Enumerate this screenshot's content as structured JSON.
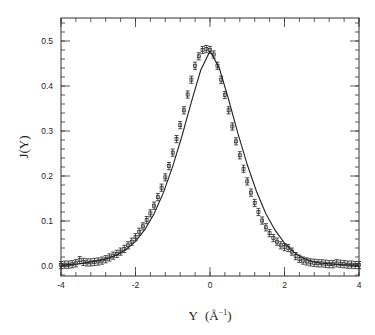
{
  "chart_data": {
    "type": "scatter",
    "title": "",
    "xlabel": "Y (Å⁻¹)",
    "xlabel_main": "Y",
    "xlabel_unit": "(Å",
    "xlabel_sup": "−1",
    "xlabel_close": ")",
    "ylabel": "J(Y)",
    "xlim": [
      -4,
      4
    ],
    "ylim": [
      -0.02,
      0.55
    ],
    "x_ticks": [
      -4,
      -2,
      0,
      2,
      4
    ],
    "x_tick_labels": [
      "-4",
      "-2",
      "0",
      "2",
      "4"
    ],
    "y_ticks": [
      0.0,
      0.1,
      0.2,
      0.3,
      0.4,
      0.5
    ],
    "y_tick_labels": [
      "0.0",
      "0.1",
      "0.2",
      "0.3",
      "0.4",
      "0.5"
    ],
    "x_minor_step": 0.4,
    "y_minor_step": 0.02,
    "grid": false,
    "legend": "none",
    "series": [
      {
        "name": "experimental data",
        "style": "points-with-errorbars",
        "x": [
          -4.0,
          -3.9,
          -3.8,
          -3.7,
          -3.6,
          -3.5,
          -3.4,
          -3.3,
          -3.2,
          -3.1,
          -3.0,
          -2.9,
          -2.8,
          -2.7,
          -2.6,
          -2.5,
          -2.4,
          -2.3,
          -2.2,
          -2.1,
          -2.0,
          -1.9,
          -1.8,
          -1.7,
          -1.6,
          -1.5,
          -1.4,
          -1.3,
          -1.2,
          -1.1,
          -1.0,
          -0.9,
          -0.8,
          -0.7,
          -0.6,
          -0.5,
          -0.4,
          -0.3,
          -0.2,
          -0.1,
          0.0,
          0.1,
          0.2,
          0.3,
          0.4,
          0.5,
          0.6,
          0.7,
          0.8,
          0.9,
          1.0,
          1.1,
          1.2,
          1.3,
          1.4,
          1.5,
          1.6,
          1.7,
          1.8,
          1.9,
          2.0,
          2.1,
          2.2,
          2.3,
          2.4,
          2.5,
          2.6,
          2.7,
          2.8,
          2.9,
          3.0,
          3.1,
          3.2,
          3.3,
          3.4,
          3.5,
          3.6,
          3.7,
          3.8,
          3.9,
          4.0
        ],
        "y": [
          0.002,
          0.003,
          0.003,
          0.004,
          0.006,
          0.013,
          0.009,
          0.008,
          0.008,
          0.009,
          0.01,
          0.012,
          0.015,
          0.019,
          0.023,
          0.027,
          0.032,
          0.038,
          0.046,
          0.054,
          0.064,
          0.076,
          0.088,
          0.102,
          0.117,
          0.134,
          0.153,
          0.174,
          0.197,
          0.222,
          0.252,
          0.282,
          0.313,
          0.346,
          0.381,
          0.414,
          0.445,
          0.466,
          0.48,
          0.482,
          0.48,
          0.47,
          0.445,
          0.414,
          0.38,
          0.346,
          0.31,
          0.277,
          0.246,
          0.216,
          0.188,
          0.163,
          0.14,
          0.12,
          0.101,
          0.086,
          0.073,
          0.062,
          0.054,
          0.046,
          0.042,
          0.04,
          0.032,
          0.022,
          0.016,
          0.012,
          0.01,
          0.008,
          0.007,
          0.006,
          0.006,
          0.005,
          0.004,
          0.004,
          0.006,
          0.005,
          0.004,
          0.003,
          0.003,
          0.002,
          0.002
        ],
        "yerr": 0.008
      },
      {
        "name": "fit",
        "style": "solid-line",
        "x": [
          -4.0,
          -3.5,
          -3.0,
          -2.75,
          -2.5,
          -2.25,
          -2.0,
          -1.75,
          -1.5,
          -1.25,
          -1.0,
          -0.75,
          -0.5,
          -0.25,
          0.0,
          0.25,
          0.5,
          0.75,
          1.0,
          1.25,
          1.5,
          1.75,
          2.0,
          2.25,
          2.5,
          2.75,
          3.0,
          3.5,
          4.0
        ],
        "y": [
          0.002,
          0.005,
          0.012,
          0.017,
          0.025,
          0.037,
          0.055,
          0.081,
          0.116,
          0.163,
          0.222,
          0.29,
          0.365,
          0.435,
          0.478,
          0.44,
          0.37,
          0.295,
          0.225,
          0.165,
          0.116,
          0.079,
          0.051,
          0.031,
          0.018,
          0.01,
          0.006,
          0.003,
          0.002
        ]
      }
    ]
  }
}
